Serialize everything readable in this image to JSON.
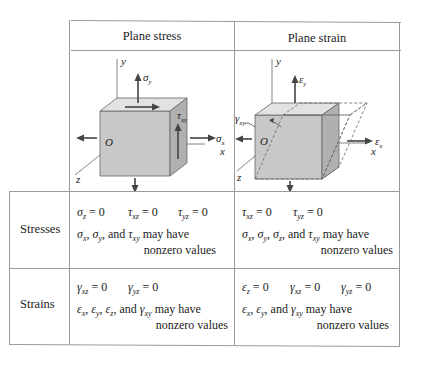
{
  "table": {
    "columns": [
      "Plane stress",
      "Plane strain"
    ],
    "rows": [
      {
        "label": "Stresses",
        "plane_stress": {
          "zeros": [
            "σz = 0",
            "τxz = 0",
            "τyz = 0"
          ],
          "nonzero_line1": "σx, σy, and τxy may have",
          "nonzero_line2": "nonzero values"
        },
        "plane_strain": {
          "zeros": [
            "τxz = 0",
            "τyz = 0"
          ],
          "nonzero_line1": "σx, σy, σz, and τxy may have",
          "nonzero_line2": "nonzero values"
        }
      },
      {
        "label": "Strains",
        "plane_stress": {
          "zeros": [
            "γxz = 0",
            "γyz = 0"
          ],
          "nonzero_line1": "εx, εy, εz, and γxy may have",
          "nonzero_line2": "nonzero values"
        },
        "plane_strain": {
          "zeros": [
            "εz = 0",
            "γxz = 0",
            "γyz = 0"
          ],
          "nonzero_line1": "εx, εy, and γxy may have",
          "nonzero_line2": "nonzero values"
        }
      }
    ]
  },
  "figures": {
    "plane_stress": {
      "labels": [
        "y",
        "σy",
        "τxy",
        "σx",
        "O",
        "x",
        "z"
      ]
    },
    "plane_strain": {
      "labels": [
        "y",
        "εy",
        "γxy",
        "εx",
        "O",
        "x",
        "z"
      ]
    }
  },
  "colors": {
    "cube_front": "#c8c8c8",
    "cube_top": "#e2e2e2",
    "cube_side": "#b0b0b0",
    "arrow": "#555555",
    "border": "#9a9a9a"
  }
}
